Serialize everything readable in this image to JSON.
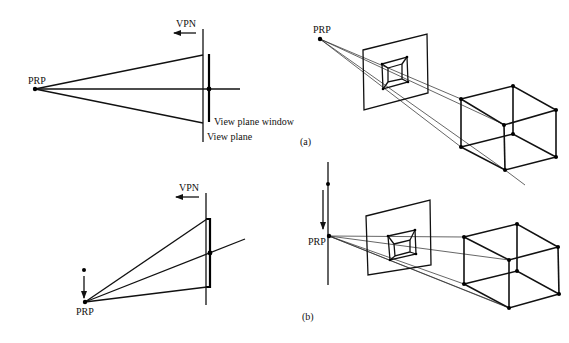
{
  "figure": {
    "panel_a": {
      "caption": "(a)",
      "side_view": {
        "vpn_label": "VPN",
        "prp_label": "PRP",
        "window_label": "View plane window",
        "plane_label": "View plane"
      },
      "perspective_view": {
        "prp_label": "PRP"
      }
    },
    "panel_b": {
      "caption": "(b)",
      "side_view": {
        "vpn_label": "VPN",
        "prp_label": "PRP"
      },
      "perspective_view": {
        "prp_label": "PRP"
      }
    }
  }
}
